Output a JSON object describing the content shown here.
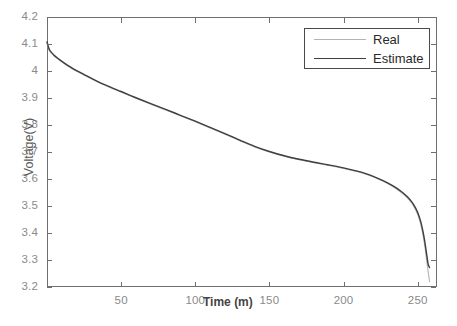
{
  "chart_data": {
    "type": "line",
    "title": "",
    "xlabel": "Time (m)",
    "ylabel": "Voltage(V)",
    "xlim": [
      0,
      263
    ],
    "ylim": [
      3.2,
      4.2
    ],
    "grid": false,
    "legend_position": "top-right",
    "xticks": [
      50,
      100,
      150,
      200,
      250
    ],
    "xtick_labels": [
      "50",
      "100",
      "150",
      "200",
      "250"
    ],
    "yticks": [
      3.2,
      3.3,
      3.4,
      3.5,
      3.6,
      3.7,
      3.8,
      3.9,
      4.0,
      4.1,
      4.2
    ],
    "ytick_labels": [
      "3.2",
      "3.3",
      "3.4",
      "3.5",
      "3.6",
      "3.7",
      "3.8",
      "3.9",
      "4",
      "4.1",
      "4.2"
    ],
    "series": [
      {
        "name": "Real",
        "color": "#b3b3b3",
        "linewidth": 1.1,
        "x": [
          0,
          1,
          2,
          3,
          5,
          8,
          12,
          16,
          20,
          25,
          30,
          35,
          40,
          45,
          50,
          60,
          70,
          80,
          90,
          100,
          110,
          120,
          130,
          140,
          150,
          160,
          170,
          180,
          190,
          200,
          210,
          215,
          220,
          225,
          230,
          235,
          240,
          243,
          246,
          248,
          250,
          252,
          253,
          254,
          255,
          256,
          257,
          258
        ],
        "y": [
          4.105,
          4.082,
          4.072,
          4.066,
          4.055,
          4.042,
          4.026,
          4.012,
          3.999,
          3.985,
          3.971,
          3.957,
          3.945,
          3.933,
          3.922,
          3.899,
          3.877,
          3.856,
          3.834,
          3.812,
          3.789,
          3.766,
          3.742,
          3.719,
          3.7,
          3.684,
          3.671,
          3.66,
          3.65,
          3.639,
          3.626,
          3.618,
          3.608,
          3.596,
          3.582,
          3.566,
          3.545,
          3.53,
          3.51,
          3.492,
          3.468,
          3.432,
          3.407,
          3.378,
          3.342,
          3.3,
          3.258,
          3.22
        ]
      },
      {
        "name": "Estimate",
        "color": "#3f3f3f",
        "linewidth": 1.4,
        "x": [
          0,
          1,
          2,
          3,
          5,
          8,
          12,
          16,
          20,
          25,
          30,
          35,
          40,
          45,
          50,
          60,
          70,
          80,
          90,
          100,
          110,
          120,
          130,
          140,
          150,
          160,
          170,
          180,
          190,
          200,
          210,
          215,
          220,
          225,
          230,
          235,
          240,
          243,
          246,
          248,
          250,
          252,
          253,
          254,
          255,
          256,
          257,
          258
        ],
        "y": [
          4.108,
          4.088,
          4.076,
          4.069,
          4.057,
          4.044,
          4.028,
          4.014,
          4.001,
          3.987,
          3.973,
          3.959,
          3.947,
          3.935,
          3.924,
          3.901,
          3.879,
          3.858,
          3.836,
          3.814,
          3.791,
          3.768,
          3.744,
          3.721,
          3.702,
          3.686,
          3.673,
          3.662,
          3.652,
          3.641,
          3.628,
          3.62,
          3.61,
          3.598,
          3.585,
          3.569,
          3.549,
          3.534,
          3.515,
          3.498,
          3.476,
          3.443,
          3.42,
          3.393,
          3.36,
          3.322,
          3.286,
          3.272
        ]
      }
    ]
  },
  "legend": {
    "entries": [
      {
        "label": "Real"
      },
      {
        "label": "Estimate"
      }
    ]
  },
  "axes": {
    "x_title": "Time (m)",
    "y_title": "Voltage(V)"
  }
}
